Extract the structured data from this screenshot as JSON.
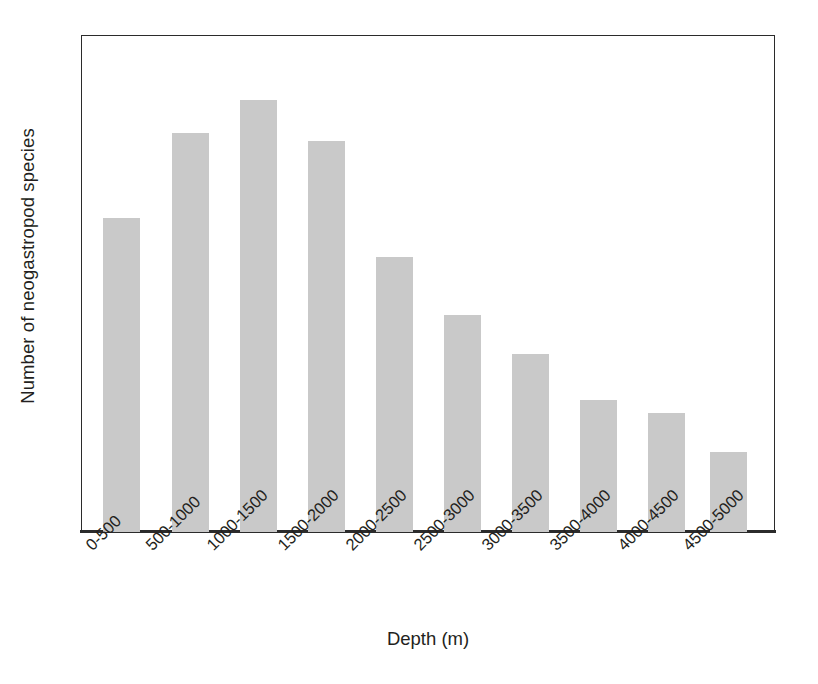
{
  "chart_data": {
    "type": "bar",
    "title": "",
    "subtitle": "",
    "xlabel": "Depth (m)",
    "ylabel": "Number of neogastropod species",
    "categories": [
      "0-500",
      "500-1000",
      "1000-1500",
      "1500-2000",
      "2000-2500",
      "2500-3000",
      "3000-3500",
      "3500-4000",
      "4000-4500",
      "4500-5000"
    ],
    "values": [
      73,
      92,
      100,
      90,
      64,
      50,
      41,
      31,
      28,
      19
    ],
    "ylim": [
      0,
      115
    ],
    "xlim_categories": 10,
    "grid": false,
    "legend": null,
    "legend_position": "none",
    "bar_color": "#c9c9c9",
    "axis_color": "#2b2b2b",
    "text_color": "#231f20",
    "y_tick_labels": [],
    "x_tick_rotation_degrees": 45,
    "annotations": [],
    "series": [
      {
        "name": "Number of neogastropod species",
        "values": [
          73,
          92,
          100,
          90,
          64,
          50,
          41,
          31,
          28,
          19
        ]
      }
    ]
  },
  "axes": {
    "x_title": "Depth (m)",
    "y_title": "Number of neogastropod species"
  },
  "bars": [
    {
      "label": "0-500",
      "value": 73,
      "left": 103,
      "width": 37,
      "height": 314
    },
    {
      "label": "500-1000",
      "value": 92,
      "left": 172,
      "width": 37,
      "height": 399
    },
    {
      "label": "1000-1500",
      "value": 100,
      "left": 240,
      "width": 37,
      "height": 432
    },
    {
      "label": "1500-2000",
      "value": 90,
      "left": 308,
      "width": 37,
      "height": 391
    },
    {
      "label": "2000-2500",
      "value": 64,
      "left": 376,
      "width": 37,
      "height": 275
    },
    {
      "label": "2500-3000",
      "value": 50,
      "left": 444,
      "width": 37,
      "height": 217
    },
    {
      "label": "3000-3500",
      "value": 41,
      "left": 512,
      "width": 37,
      "height": 178
    },
    {
      "label": "3500-4000",
      "value": 31,
      "left": 580,
      "width": 37,
      "height": 132
    },
    {
      "label": "4000-4500",
      "value": 28,
      "left": 648,
      "width": 37,
      "height": 119
    },
    {
      "label": "4500-5000",
      "value": 19,
      "left": 710,
      "width": 37,
      "height": 80
    }
  ],
  "tick_label_positions": [
    {
      "label": "0-500",
      "x": 82
    },
    {
      "label": "500-1000",
      "x": 142
    },
    {
      "label": "1000-1500",
      "x": 203
    },
    {
      "label": "1500-2000",
      "x": 274
    },
    {
      "label": "2000-2500",
      "x": 342
    },
    {
      "label": "2500-3000",
      "x": 410
    },
    {
      "label": "3000-3500",
      "x": 478
    },
    {
      "label": "3500-4000",
      "x": 546
    },
    {
      "label": "4000-4500",
      "x": 614
    },
    {
      "label": "4500-5000",
      "x": 679
    }
  ]
}
